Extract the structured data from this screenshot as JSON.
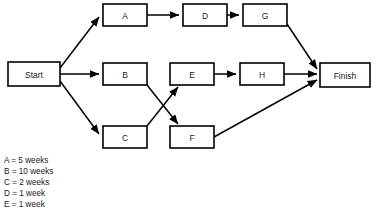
{
  "diagram": {
    "type": "network-activity-diagram",
    "background_color": "#ffffff",
    "line_color": "#000000",
    "text_color": "#1a1a1a",
    "nodes": [
      {
        "id": "start",
        "label": "Start",
        "x": 8,
        "y": 62,
        "w": 52,
        "h": 24
      },
      {
        "id": "a",
        "label": "A",
        "x": 103,
        "y": 4,
        "w": 44,
        "h": 22
      },
      {
        "id": "d",
        "label": "D",
        "x": 183,
        "y": 4,
        "w": 44,
        "h": 22
      },
      {
        "id": "g",
        "label": "G",
        "x": 243,
        "y": 4,
        "w": 44,
        "h": 22
      },
      {
        "id": "b",
        "label": "B",
        "x": 103,
        "y": 63,
        "w": 44,
        "h": 22
      },
      {
        "id": "e",
        "label": "E",
        "x": 170,
        "y": 63,
        "w": 44,
        "h": 22
      },
      {
        "id": "h",
        "label": "H",
        "x": 240,
        "y": 63,
        "w": 44,
        "h": 22
      },
      {
        "id": "c",
        "label": "C",
        "x": 103,
        "y": 126,
        "w": 44,
        "h": 22
      },
      {
        "id": "f",
        "label": "F",
        "x": 170,
        "y": 126,
        "w": 44,
        "h": 22
      },
      {
        "id": "finish",
        "label": "Finish",
        "x": 320,
        "y": 63,
        "w": 50,
        "h": 24
      }
    ],
    "edges": [
      {
        "id": "start-a",
        "from": "Start",
        "to": "A",
        "x1": 60,
        "y1": 68,
        "x2": 99,
        "y2": 17
      },
      {
        "id": "start-b",
        "from": "Start",
        "to": "B",
        "x1": 60,
        "y1": 74,
        "x2": 99,
        "y2": 74
      },
      {
        "id": "start-c",
        "from": "Start",
        "to": "C",
        "x1": 60,
        "y1": 81,
        "x2": 99,
        "y2": 134
      },
      {
        "id": "a-d",
        "from": "A",
        "to": "D",
        "x1": 147,
        "y1": 15,
        "x2": 179,
        "y2": 15
      },
      {
        "id": "d-g",
        "from": "D",
        "to": "G",
        "x1": 227,
        "y1": 15,
        "x2": 239,
        "y2": 15
      },
      {
        "id": "g-finish",
        "from": "G",
        "to": "Finish",
        "x1": 287,
        "y1": 24,
        "x2": 317,
        "y2": 69
      },
      {
        "id": "b-f",
        "from": "B",
        "to": "F",
        "x1": 147,
        "y1": 85,
        "x2": 178,
        "y2": 124
      },
      {
        "id": "c-e",
        "from": "C",
        "to": "E",
        "x1": 147,
        "y1": 126,
        "x2": 178,
        "y2": 87
      },
      {
        "id": "e-h",
        "from": "E",
        "to": "H",
        "x1": 214,
        "y1": 74,
        "x2": 236,
        "y2": 74
      },
      {
        "id": "h-finish",
        "from": "H",
        "to": "Finish",
        "x1": 284,
        "y1": 74,
        "x2": 317,
        "y2": 74
      },
      {
        "id": "f-finish",
        "from": "F",
        "to": "Finish",
        "x1": 214,
        "y1": 137,
        "x2": 317,
        "y2": 80
      }
    ]
  },
  "legend": {
    "items": [
      {
        "id": "legend-a",
        "text": "A = 5 weeks",
        "x": 4,
        "y": 161
      },
      {
        "id": "legend-b",
        "text": "B = 10 weeks",
        "x": 4,
        "y": 172
      },
      {
        "id": "legend-c",
        "text": "C = 2 weeks",
        "x": 4,
        "y": 183
      },
      {
        "id": "legend-d",
        "text": "D = 1 week",
        "x": 4,
        "y": 194
      },
      {
        "id": "legend-e",
        "text": "E = 1 week",
        "x": 4,
        "y": 205
      }
    ]
  }
}
